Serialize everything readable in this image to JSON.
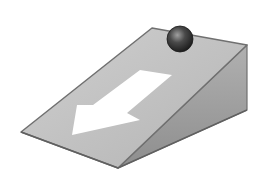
{
  "diagram": {
    "colors": {
      "background": "#ffffff",
      "ramp_top": "#bdbdbd",
      "ramp_top_light": "#cfcfcf",
      "ramp_side": "#a6a6a6",
      "ramp_side_dark": "#8e8e8e",
      "edge": "#707070",
      "arrow": "#ffffff",
      "ball_light": "#a0a0a0",
      "ball_dark": "#1e1e1e"
    },
    "ramp": {
      "top_face": [
        [
          152,
          28
        ],
        [
          247,
          45
        ],
        [
          118,
          168
        ],
        [
          21,
          132
        ]
      ],
      "side_face": [
        [
          247,
          45
        ],
        [
          247,
          110
        ],
        [
          118,
          168
        ]
      ]
    },
    "ball": {
      "cx": 180,
      "cy": 39,
      "r": 13
    },
    "arrow": {
      "points": [
        [
          140,
          70
        ],
        [
          172,
          75
        ],
        [
          127,
          113
        ],
        [
          140,
          120
        ],
        [
          72,
          135
        ],
        [
          77,
          105
        ],
        [
          93,
          105
        ]
      ]
    }
  }
}
